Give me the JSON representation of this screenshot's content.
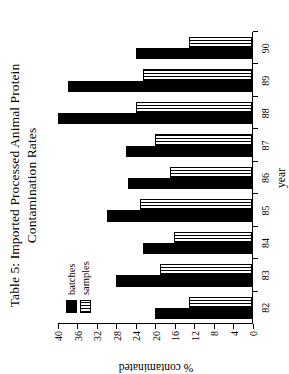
{
  "figure": {
    "title_line1": "Table 5: Imported Processed Animal Protein",
    "title_line2": "Contamination Rates"
  },
  "legend": {
    "items": [
      {
        "label": "batches",
        "swatch": "solid-black-swatch"
      },
      {
        "label": "samples",
        "swatch": "vertical-hatch-swatch"
      }
    ]
  },
  "chart_data": {
    "type": "bar",
    "title": "Table 5: Imported Processed Animal Protein Contamination Rates",
    "xlabel": "year",
    "ylabel": "% contaminated",
    "categories": [
      "82",
      "83",
      "84",
      "85",
      "86",
      "87",
      "88",
      "89",
      "90"
    ],
    "series": [
      {
        "name": "batches",
        "values": [
          20,
          28,
          22.5,
          30,
          25.5,
          26,
          40,
          38,
          24
        ]
      },
      {
        "name": "samples",
        "values": [
          13,
          19,
          16,
          23,
          17,
          20,
          24,
          22.5,
          13
        ]
      }
    ],
    "ylim": [
      0,
      40
    ],
    "yticks": [
      0,
      4,
      8,
      12,
      16,
      20,
      24,
      28,
      32,
      36,
      40
    ],
    "ytick_labels": [
      "0",
      "4",
      "8",
      "12",
      "16",
      "20",
      "24",
      "28",
      "32",
      "36",
      "40"
    ],
    "grid": false,
    "legend_position": "upper-left",
    "orientation": "page-rotated-90-ccw"
  }
}
